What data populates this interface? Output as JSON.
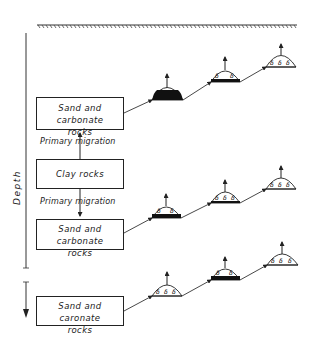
{
  "diagram": {
    "axis_label": "Depth",
    "surface": "ground-surface",
    "boxes": [
      {
        "id": "reservoir-1",
        "line1": "Sand and carbonate",
        "line2": "rocks"
      },
      {
        "id": "source-clay",
        "line1": "Clay rocks",
        "line2": ""
      },
      {
        "id": "reservoir-2",
        "line1": "Sand and carbonate",
        "line2": "rocks"
      },
      {
        "id": "reservoir-3",
        "line1": "Sand and caronate",
        "line2": "rocks"
      }
    ],
    "migration_labels": [
      {
        "text": "Primary migration",
        "direction": "up"
      },
      {
        "text": "Primary migration",
        "direction": "down"
      }
    ],
    "trap_rows": [
      {
        "traps": [
          {
            "fill": "oil-heavy",
            "gas_symbols": 1
          },
          {
            "fill": "oil-thin",
            "gas_symbols": 2
          },
          {
            "fill": "gas-only",
            "gas_symbols": 3
          }
        ]
      },
      {
        "traps": [
          {
            "fill": "oil-medium",
            "gas_symbols": 2
          },
          {
            "fill": "oil-thin",
            "gas_symbols": 3
          },
          {
            "fill": "gas-only",
            "gas_symbols": 3
          }
        ]
      },
      {
        "traps": [
          {
            "fill": "gas-only",
            "gas_symbols": 3
          },
          {
            "fill": "oil-medium",
            "gas_symbols": 2
          },
          {
            "fill": "gas-only",
            "gas_symbols": 3
          }
        ]
      }
    ],
    "colors": {
      "line": "#222222",
      "oil": "#111111",
      "background": "#ffffff"
    }
  }
}
